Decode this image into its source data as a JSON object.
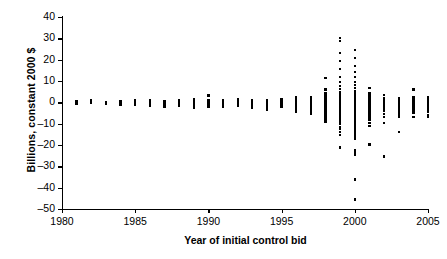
{
  "chart_data": {
    "type": "scatter",
    "title": "",
    "xlabel": "Year of initial control bid",
    "ylabel": "Billions, constant 2000 $",
    "xlim": [
      1980,
      2005
    ],
    "ylim": [
      -50,
      40
    ],
    "xticks": [
      1980,
      1985,
      1990,
      1995,
      2000,
      2005
    ],
    "yticks": [
      40,
      30,
      20,
      10,
      0,
      -10,
      -20,
      -30,
      -40,
      -50
    ],
    "xtick_labels": [
      "1980",
      "1985",
      "1990",
      "1995",
      "2000",
      "2005"
    ],
    "ytick_labels": [
      "40",
      "30",
      "20",
      "10",
      "0",
      "–10",
      "–20",
      "–30",
      "–40",
      "–50"
    ],
    "grid": false,
    "legend": null,
    "marker": "square",
    "marker_color": "#000000",
    "series": [
      {
        "name": "Initial control bids",
        "points": [
          [
            1981,
            0.4
          ],
          [
            1981,
            -0.2
          ],
          [
            1981,
            0.1
          ],
          [
            1981,
            -0.7
          ],
          [
            1982,
            0.5
          ],
          [
            1982,
            0.0
          ],
          [
            1982,
            -0.4
          ],
          [
            1982,
            0.9
          ],
          [
            1983,
            0.3
          ],
          [
            1983,
            -0.3
          ],
          [
            1983,
            -0.9
          ],
          [
            1983,
            0.2
          ],
          [
            1984,
            0.6
          ],
          [
            1984,
            0.0
          ],
          [
            1984,
            -0.5
          ],
          [
            1984,
            -1.1
          ],
          [
            1985,
            0.8
          ],
          [
            1985,
            0.1
          ],
          [
            1985,
            -0.4
          ],
          [
            1985,
            -1.0
          ],
          [
            1986,
            1.0
          ],
          [
            1986,
            0.2
          ],
          [
            1986,
            -0.3
          ],
          [
            1986,
            -1.2
          ],
          [
            1986,
            -1.8
          ],
          [
            1987,
            0.7
          ],
          [
            1987,
            0.0
          ],
          [
            1987,
            -0.6
          ],
          [
            1987,
            -1.4
          ],
          [
            1987,
            -2.2
          ],
          [
            1988,
            1.2
          ],
          [
            1988,
            0.3
          ],
          [
            1988,
            -0.2
          ],
          [
            1988,
            -0.9
          ],
          [
            1988,
            -1.6
          ],
          [
            1989,
            1.4
          ],
          [
            1989,
            0.5
          ],
          [
            1989,
            -0.1
          ],
          [
            1989,
            -0.8
          ],
          [
            1989,
            -1.5
          ],
          [
            1989,
            -2.4
          ],
          [
            1990,
            3.2
          ],
          [
            1990,
            1.1
          ],
          [
            1990,
            0.2
          ],
          [
            1990,
            -0.5
          ],
          [
            1990,
            -1.3
          ],
          [
            1990,
            -2.0
          ],
          [
            1991,
            1.0
          ],
          [
            1991,
            0.2
          ],
          [
            1991,
            -0.4
          ],
          [
            1991,
            -1.1
          ],
          [
            1991,
            -1.9
          ],
          [
            1992,
            1.3
          ],
          [
            1992,
            0.4
          ],
          [
            1992,
            -0.2
          ],
          [
            1992,
            -0.9
          ],
          [
            1992,
            -1.7
          ],
          [
            1993,
            0.9
          ],
          [
            1993,
            0.1
          ],
          [
            1993,
            -0.6
          ],
          [
            1993,
            -1.5
          ],
          [
            1993,
            -2.6
          ],
          [
            1994,
            1.1
          ],
          [
            1994,
            0.3
          ],
          [
            1994,
            -0.4
          ],
          [
            1994,
            -1.2
          ],
          [
            1994,
            -2.1
          ],
          [
            1994,
            -3.4
          ],
          [
            1995,
            1.5
          ],
          [
            1995,
            0.6
          ],
          [
            1995,
            0.0
          ],
          [
            1995,
            -0.7
          ],
          [
            1995,
            -1.4
          ],
          [
            1995,
            -2.2
          ],
          [
            1996,
            2.6
          ],
          [
            1996,
            1.6
          ],
          [
            1996,
            0.8
          ],
          [
            1996,
            0.1
          ],
          [
            1996,
            -0.6
          ],
          [
            1996,
            -1.4
          ],
          [
            1996,
            -2.3
          ],
          [
            1996,
            -3.2
          ],
          [
            1996,
            -4.3
          ],
          [
            1997,
            2.2
          ],
          [
            1997,
            1.2
          ],
          [
            1997,
            0.4
          ],
          [
            1997,
            -0.3
          ],
          [
            1997,
            -1.0
          ],
          [
            1997,
            -1.8
          ],
          [
            1997,
            -2.7
          ],
          [
            1997,
            -3.6
          ],
          [
            1997,
            -4.6
          ],
          [
            1997,
            -5.2
          ],
          [
            1998,
            11.4
          ],
          [
            1998,
            6.0
          ],
          [
            1998,
            4.4
          ],
          [
            1998,
            3.2
          ],
          [
            1998,
            2.4
          ],
          [
            1998,
            1.6
          ],
          [
            1998,
            1.0
          ],
          [
            1998,
            0.4
          ],
          [
            1998,
            -0.2
          ],
          [
            1998,
            -0.8
          ],
          [
            1998,
            -1.5
          ],
          [
            1998,
            -2.2
          ],
          [
            1998,
            -3.0
          ],
          [
            1998,
            -3.8
          ],
          [
            1998,
            -4.6
          ],
          [
            1998,
            -5.4
          ],
          [
            1998,
            -6.4
          ],
          [
            1998,
            -7.6
          ],
          [
            1998,
            -9.0
          ],
          [
            1999,
            30.2
          ],
          [
            1999,
            28.6
          ],
          [
            1999,
            23.0
          ],
          [
            1999,
            19.4
          ],
          [
            1999,
            15.6
          ],
          [
            1999,
            12.0
          ],
          [
            1999,
            9.4
          ],
          [
            1999,
            7.6
          ],
          [
            1999,
            6.2
          ],
          [
            1999,
            5.0
          ],
          [
            1999,
            4.0
          ],
          [
            1999,
            3.2
          ],
          [
            1999,
            2.5
          ],
          [
            1999,
            1.9
          ],
          [
            1999,
            1.3
          ],
          [
            1999,
            0.8
          ],
          [
            1999,
            0.3
          ],
          [
            1999,
            -0.2
          ],
          [
            1999,
            -0.7
          ],
          [
            1999,
            -1.2
          ],
          [
            1999,
            -1.8
          ],
          [
            1999,
            -2.4
          ],
          [
            1999,
            -3.0
          ],
          [
            1999,
            -3.6
          ],
          [
            1999,
            -4.3
          ],
          [
            1999,
            -5.0
          ],
          [
            1999,
            -5.8
          ],
          [
            1999,
            -6.6
          ],
          [
            1999,
            -7.4
          ],
          [
            1999,
            -8.2
          ],
          [
            1999,
            -9.2
          ],
          [
            1999,
            -10.2
          ],
          [
            1999,
            -11.4
          ],
          [
            1999,
            -12.6
          ],
          [
            1999,
            -13.8
          ],
          [
            1999,
            -15.2
          ],
          [
            1999,
            -21.2
          ],
          [
            2000,
            24.4
          ],
          [
            2000,
            20.8
          ],
          [
            2000,
            17.0
          ],
          [
            2000,
            14.2
          ],
          [
            2000,
            11.8
          ],
          [
            2000,
            9.6
          ],
          [
            2000,
            8.0
          ],
          [
            2000,
            6.6
          ],
          [
            2000,
            5.4
          ],
          [
            2000,
            4.4
          ],
          [
            2000,
            3.6
          ],
          [
            2000,
            2.9
          ],
          [
            2000,
            2.3
          ],
          [
            2000,
            1.7
          ],
          [
            2000,
            1.2
          ],
          [
            2000,
            0.7
          ],
          [
            2000,
            0.2
          ],
          [
            2000,
            -0.3
          ],
          [
            2000,
            -0.9
          ],
          [
            2000,
            -1.5
          ],
          [
            2000,
            -2.1
          ],
          [
            2000,
            -2.7
          ],
          [
            2000,
            -3.3
          ],
          [
            2000,
            -4.0
          ],
          [
            2000,
            -4.7
          ],
          [
            2000,
            -5.4
          ],
          [
            2000,
            -6.2
          ],
          [
            2000,
            -7.0
          ],
          [
            2000,
            -7.8
          ],
          [
            2000,
            -8.6
          ],
          [
            2000,
            -9.6
          ],
          [
            2000,
            -10.6
          ],
          [
            2000,
            -11.8
          ],
          [
            2000,
            -13.0
          ],
          [
            2000,
            -14.2
          ],
          [
            2000,
            -15.6
          ],
          [
            2000,
            -17.0
          ],
          [
            2000,
            -22.2
          ],
          [
            2000,
            -23.4
          ],
          [
            2000,
            -24.4
          ],
          [
            2000,
            -36.2
          ],
          [
            2000,
            -45.6
          ],
          [
            2001,
            6.6
          ],
          [
            2001,
            4.2
          ],
          [
            2001,
            2.8
          ],
          [
            2001,
            1.8
          ],
          [
            2001,
            1.0
          ],
          [
            2001,
            0.3
          ],
          [
            2001,
            -0.4
          ],
          [
            2001,
            -1.1
          ],
          [
            2001,
            -1.9
          ],
          [
            2001,
            -2.7
          ],
          [
            2001,
            -3.5
          ],
          [
            2001,
            -4.4
          ],
          [
            2001,
            -5.4
          ],
          [
            2001,
            -6.6
          ],
          [
            2001,
            -8.0
          ],
          [
            2001,
            -9.6
          ],
          [
            2001,
            -11.2
          ],
          [
            2001,
            -19.8
          ],
          [
            2002,
            3.6
          ],
          [
            2002,
            2.0
          ],
          [
            2002,
            1.0
          ],
          [
            2002,
            0.2
          ],
          [
            2002,
            -0.6
          ],
          [
            2002,
            -1.4
          ],
          [
            2002,
            -2.3
          ],
          [
            2002,
            -3.2
          ],
          [
            2002,
            -4.2
          ],
          [
            2002,
            -5.4
          ],
          [
            2002,
            -6.8
          ],
          [
            2002,
            -9.8
          ],
          [
            2002,
            -25.4
          ],
          [
            2003,
            2.0
          ],
          [
            2003,
            1.0
          ],
          [
            2003,
            0.2
          ],
          [
            2003,
            -0.6
          ],
          [
            2003,
            -1.4
          ],
          [
            2003,
            -2.2
          ],
          [
            2003,
            -3.1
          ],
          [
            2003,
            -4.0
          ],
          [
            2003,
            -5.2
          ],
          [
            2003,
            -6.6
          ],
          [
            2003,
            -13.8
          ],
          [
            2004,
            6.0
          ],
          [
            2004,
            2.2
          ],
          [
            2004,
            1.2
          ],
          [
            2004,
            0.4
          ],
          [
            2004,
            -0.4
          ],
          [
            2004,
            -1.2
          ],
          [
            2004,
            -2.0
          ],
          [
            2004,
            -2.9
          ],
          [
            2004,
            -3.8
          ],
          [
            2004,
            -5.0
          ],
          [
            2004,
            -7.0
          ],
          [
            2005,
            2.4
          ],
          [
            2005,
            1.4
          ],
          [
            2005,
            0.6
          ],
          [
            2005,
            -0.2
          ],
          [
            2005,
            -1.0
          ],
          [
            2005,
            -1.8
          ],
          [
            2005,
            -2.6
          ],
          [
            2005,
            -3.5
          ],
          [
            2005,
            -4.6
          ],
          [
            2005,
            -6.0
          ],
          [
            2005,
            -6.8
          ]
        ]
      }
    ]
  }
}
